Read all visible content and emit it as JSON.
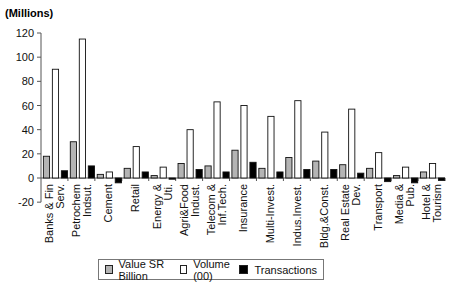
{
  "chart_data": {
    "type": "bar",
    "title": "",
    "unit_label": "(Millions)",
    "xlabel": "",
    "ylabel": "(Millions)",
    "ylim": [
      -20,
      120
    ],
    "yticks": [
      -20,
      0,
      20,
      40,
      60,
      80,
      100,
      120
    ],
    "grid": false,
    "legend_position": "bottom",
    "categories": [
      "Banks & Fin Serv.",
      "Petrochem Indsut.",
      "Cement",
      "Retail",
      "Energy & Uti.",
      "Agri&Food Indust.",
      "Telecom & Inf.Tech.",
      "Insurance",
      "Multi-Invest.",
      "Indus.Invest.",
      "Bldg.&Const.",
      "Real Estate Dev.",
      "Transport",
      "Media & Pub.",
      "Hotel & Tourism"
    ],
    "category_lines": [
      [
        "Banks & Fin",
        "Serv."
      ],
      [
        "Petrochem",
        "Indsut."
      ],
      [
        "Cement"
      ],
      [
        "Retail"
      ],
      [
        "Energy &",
        "Uti."
      ],
      [
        "Agri&Food",
        "Indust."
      ],
      [
        "Telecom &",
        "Inf.Tech."
      ],
      [
        "Insurance"
      ],
      [
        "Multi-Invest."
      ],
      [
        "Indus.Invest."
      ],
      [
        "Bldg.&Const."
      ],
      [
        "Real Estate",
        "Dev."
      ],
      [
        "Transport"
      ],
      [
        "Media &",
        "Pub."
      ],
      [
        "Hotel &",
        "Tourism"
      ]
    ],
    "series": [
      {
        "name": "Value SR Billion",
        "color": "#b4b4b4",
        "values": [
          18,
          30,
          3,
          8,
          2,
          12,
          10,
          23,
          8,
          17,
          14,
          11,
          8,
          2,
          5
        ]
      },
      {
        "name": "Volume (00)",
        "color": "#ffffff",
        "values": [
          90,
          115,
          5,
          26,
          9,
          40,
          63,
          60,
          51,
          64,
          38,
          57,
          21,
          9,
          12
        ]
      },
      {
        "name": "Transactions",
        "color": "#000000",
        "values": [
          6,
          10,
          -4,
          5,
          -1,
          7,
          5,
          13,
          5,
          7,
          7,
          4,
          -3,
          -4,
          -2
        ]
      }
    ]
  },
  "legend": {
    "items": [
      {
        "label": "Value SR Billion",
        "color": "#b4b4b4"
      },
      {
        "label": "Volume (00)",
        "color": "#ffffff"
      },
      {
        "label": "Transactions",
        "color": "#000000"
      }
    ]
  }
}
